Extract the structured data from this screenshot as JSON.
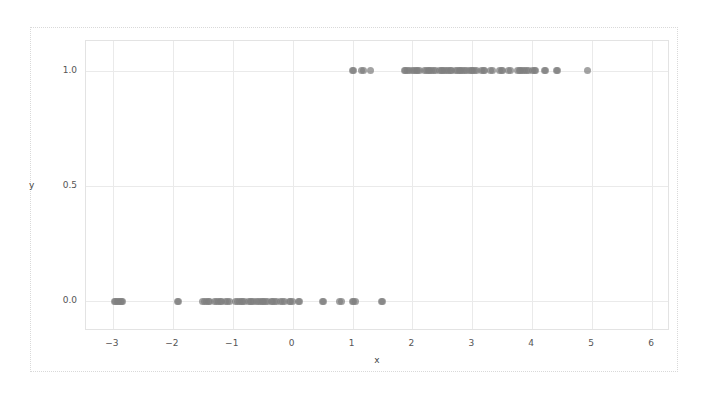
{
  "chart_data": {
    "type": "scatter",
    "title": "",
    "xlabel": "x",
    "ylabel": "y",
    "xlim": [
      -3.45,
      6.3
    ],
    "ylim": [
      -0.13,
      1.13
    ],
    "grid": true,
    "legend": null,
    "marker": {
      "color": "#7f7f7f",
      "shape": "circle",
      "size": 7,
      "opacity": 0.72
    },
    "xticks": [
      -3,
      -2,
      -1,
      0,
      1,
      2,
      3,
      4,
      5,
      6
    ],
    "xticklabels": [
      "−3",
      "−2",
      "−1",
      "0",
      "1",
      "2",
      "3",
      "4",
      "5",
      "6"
    ],
    "yticks": [
      0.0,
      0.5,
      1.0
    ],
    "yticklabels": [
      "0.0",
      "0.5",
      "1.0"
    ],
    "series": [
      {
        "name": "class 0",
        "y": 0.0,
        "x": [
          -2.98,
          -2.95,
          -2.93,
          -2.9,
          -2.88,
          -2.86,
          -2.84,
          -1.93,
          -1.9,
          -1.5,
          -1.47,
          -1.44,
          -1.41,
          -1.38,
          -1.3,
          -1.27,
          -1.24,
          -1.21,
          -1.18,
          -1.12,
          -1.09,
          -1.06,
          -0.95,
          -0.92,
          -0.89,
          -0.86,
          -0.83,
          -0.8,
          -0.74,
          -0.71,
          -0.68,
          -0.65,
          -0.6,
          -0.57,
          -0.54,
          -0.51,
          -0.48,
          -0.45,
          -0.42,
          -0.36,
          -0.33,
          -0.3,
          -0.27,
          -0.2,
          -0.17,
          -0.14,
          -0.06,
          -0.03,
          0.0,
          0.1,
          0.12,
          0.5,
          0.52,
          0.78,
          0.81,
          1.0,
          1.02,
          1.05,
          1.48,
          1.5
        ]
      },
      {
        "name": "class 1",
        "y": 1.0,
        "x": [
          1.0,
          1.02,
          1.15,
          1.18,
          1.3,
          1.86,
          1.89,
          1.92,
          1.95,
          2.0,
          2.03,
          2.06,
          2.09,
          2.12,
          2.2,
          2.23,
          2.26,
          2.29,
          2.32,
          2.35,
          2.38,
          2.45,
          2.48,
          2.51,
          2.54,
          2.57,
          2.6,
          2.63,
          2.66,
          2.72,
          2.75,
          2.78,
          2.81,
          2.84,
          2.87,
          2.9,
          2.95,
          2.98,
          3.01,
          3.04,
          3.07,
          3.15,
          3.18,
          3.21,
          3.3,
          3.33,
          3.45,
          3.48,
          3.51,
          3.6,
          3.63,
          3.75,
          3.78,
          3.81,
          3.84,
          3.87,
          3.9,
          3.93,
          4.0,
          4.03,
          4.06,
          4.2,
          4.22,
          4.4,
          4.42,
          4.92
        ]
      }
    ]
  }
}
